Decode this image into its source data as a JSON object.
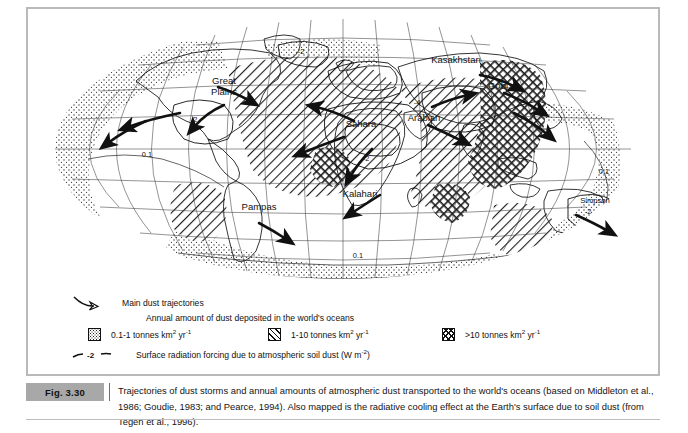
{
  "figure": {
    "number": "Fig. 3.30",
    "caption": "Trajectories of dust storms and annual amounts of atmospheric dust transported to the world's oceans (based on Middleton et al., 1986; Goudie, 1983; and Pearce, 1994). Also mapped is the radiative cooling effect at the Earth's surface due to soil dust (from Tegen et al., 1996)."
  },
  "legend": {
    "trajectories_label": "Main dust trajectories",
    "deposition_heading": "Annual amount of dust deposited in the world's oceans",
    "classes": [
      {
        "label_prefix": "0.1-1 tonnes km",
        "exp1": "2",
        "unit_mid": " yr",
        "exp2": "-1",
        "pattern": "stipple-dots"
      },
      {
        "label_prefix": "1-10 tonnes km",
        "exp1": "2",
        "unit_mid": " yr",
        "exp2": "-1",
        "pattern": "diagonal-hatch"
      },
      {
        "label_prefix": ">10 tonnes km",
        "exp1": "2",
        "unit_mid": " yr",
        "exp2": "-1",
        "pattern": "cross-hatch"
      }
    ],
    "contour": {
      "sample_value": "-2",
      "label_prefix": "Surface radiation forcing due to atmospheric soil dust (W m",
      "exp": "-2",
      "label_suffix": ")"
    }
  },
  "map": {
    "projection": "elliptical-mollweide",
    "region_labels": [
      {
        "name": "Great Plains",
        "line1": "Great",
        "line2": "Plains",
        "x": 196,
        "y": 75
      },
      {
        "name": "Sahara",
        "text": "Sahara",
        "x": 333,
        "y": 118
      },
      {
        "name": "Kasakhstan",
        "text": "Kasakhstan",
        "x": 428,
        "y": 54
      },
      {
        "name": "Gobi",
        "text": "Gobi",
        "x": 470,
        "y": 80
      },
      {
        "name": "Arabian",
        "text": "Arabian",
        "x": 396,
        "y": 112
      },
      {
        "name": "Kalahari",
        "text": "Kalahari",
        "x": 332,
        "y": 188
      },
      {
        "name": "Pampas",
        "text": "Pampas",
        "x": 231,
        "y": 201
      },
      {
        "name": "Simpson",
        "text": "Simpson",
        "x": 567,
        "y": 194
      }
    ],
    "contour_labels": [
      {
        "value": "0.1",
        "x": 119,
        "y": 148
      },
      {
        "value": "0.1",
        "x": 330,
        "y": 249
      },
      {
        "value": "0.1",
        "x": 576,
        "y": 165
      },
      {
        "value": "-2",
        "x": 166,
        "y": 113
      },
      {
        "value": "-2",
        "x": 338,
        "y": 152
      },
      {
        "value": "-2",
        "x": 560,
        "y": 205
      },
      {
        "value": "-4",
        "x": 389,
        "y": 96
      },
      {
        "value": "-2",
        "x": 273,
        "y": 45
      }
    ]
  },
  "colors": {
    "frame_border": "#b9b9b9",
    "caption_bar": "#c9c9c9",
    "caption_tag": "#a8a8a8",
    "ink": "#1a1a1a",
    "paper": "#ffffff"
  }
}
